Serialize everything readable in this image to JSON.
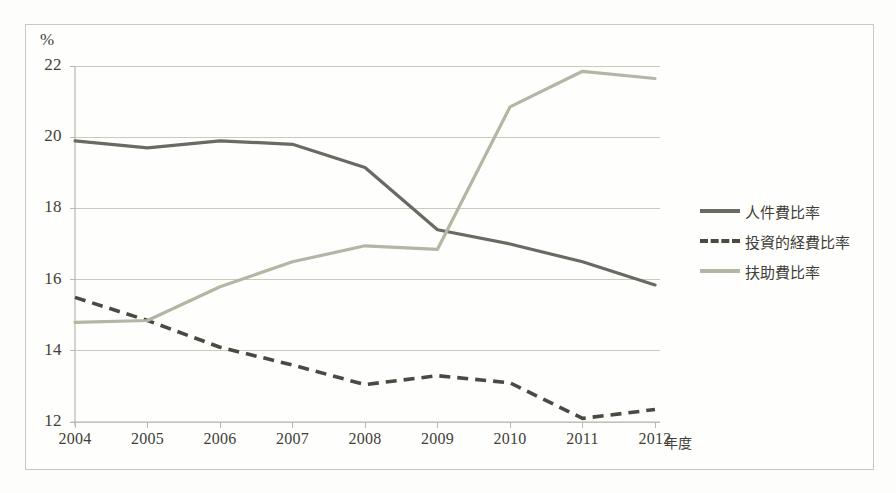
{
  "chart_data": {
    "type": "line",
    "title": "",
    "xlabel": "年度",
    "ylabel": "%",
    "x": [
      "2004",
      "2005",
      "2006",
      "2007",
      "2008",
      "2009",
      "2010",
      "2011",
      "2012"
    ],
    "categories": [
      "2004",
      "2005",
      "2006",
      "2007",
      "2008",
      "2009",
      "2010",
      "2011",
      "2012"
    ],
    "ylim": [
      12,
      22
    ],
    "yticks": [
      12,
      14,
      16,
      18,
      20,
      22
    ],
    "ytick_labels": [
      "12",
      "14",
      "16",
      "18",
      "20",
      "22"
    ],
    "grid": "horizontal",
    "legend_position": "right",
    "series": [
      {
        "name": "人件費比率",
        "style": "solid",
        "color": "#6a6a62",
        "values": [
          19.9,
          19.7,
          19.9,
          19.8,
          19.15,
          17.4,
          17.0,
          16.5,
          15.85
        ]
      },
      {
        "name": "投資的経費比率",
        "style": "dashed",
        "color": "#4a4a42",
        "values": [
          15.5,
          14.85,
          14.1,
          13.6,
          13.05,
          13.3,
          13.1,
          12.1,
          12.35
        ]
      },
      {
        "name": "扶助費比率",
        "style": "solid",
        "color": "#b5b5a5",
        "values": [
          14.8,
          14.85,
          15.8,
          16.5,
          16.95,
          16.85,
          20.85,
          21.85,
          21.65
        ]
      }
    ]
  },
  "axis": {
    "y_unit_label": "%",
    "x_axis_title": "年度",
    "ytick_labels": [
      "22",
      "20",
      "18",
      "16",
      "14",
      "12"
    ],
    "xtick_labels": [
      "2004",
      "2005",
      "2006",
      "2007",
      "2008",
      "2009",
      "2010",
      "2011",
      "2012"
    ]
  },
  "legend": {
    "items": [
      {
        "label": "人件費比率",
        "key": "solid-dark-line-key",
        "color": "#6a6a62"
      },
      {
        "label": "投資的経費比率",
        "key": "dashed-dark-line-key",
        "color": "#4a4a42"
      },
      {
        "label": "扶助費比率",
        "key": "solid-light-line-key",
        "color": "#b5b5a5"
      }
    ]
  },
  "colors": {
    "series_1": "#6a6a62",
    "series_2": "#4a4a42",
    "series_3": "#b5b5a5",
    "gridline": "#c9c9bc",
    "axis": "#b8b8ab",
    "frame": "#cfcfc4",
    "text": "#3f3f3a",
    "background": "#fefefc"
  }
}
